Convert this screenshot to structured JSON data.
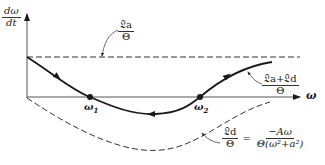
{
  "axes": {
    "y_label_num": "dω",
    "y_label_den": "dt",
    "x_label": "ω"
  },
  "curves": {
    "upper_dashed": {
      "label_num": "𝔏a",
      "label_den": "Θ",
      "style": "dashed"
    },
    "solid": {
      "label_num": "𝔏a+𝔏d",
      "label_den": "Θ",
      "style": "solid"
    },
    "lower_dashed": {
      "label_num": "𝔏d",
      "label_den": "Θ",
      "equals": "=",
      "rhs_num": "−Aω",
      "rhs_den": "Θ(ω²+a²)",
      "style": "dashed"
    }
  },
  "points": [
    {
      "label": "ω₁",
      "base": "ω",
      "sub": "1"
    },
    {
      "label": "ω₂",
      "base": "ω",
      "sub": "2"
    }
  ],
  "colors": {
    "line": "#1a1a1a",
    "dashed": "#333333",
    "axis": "#555555"
  }
}
